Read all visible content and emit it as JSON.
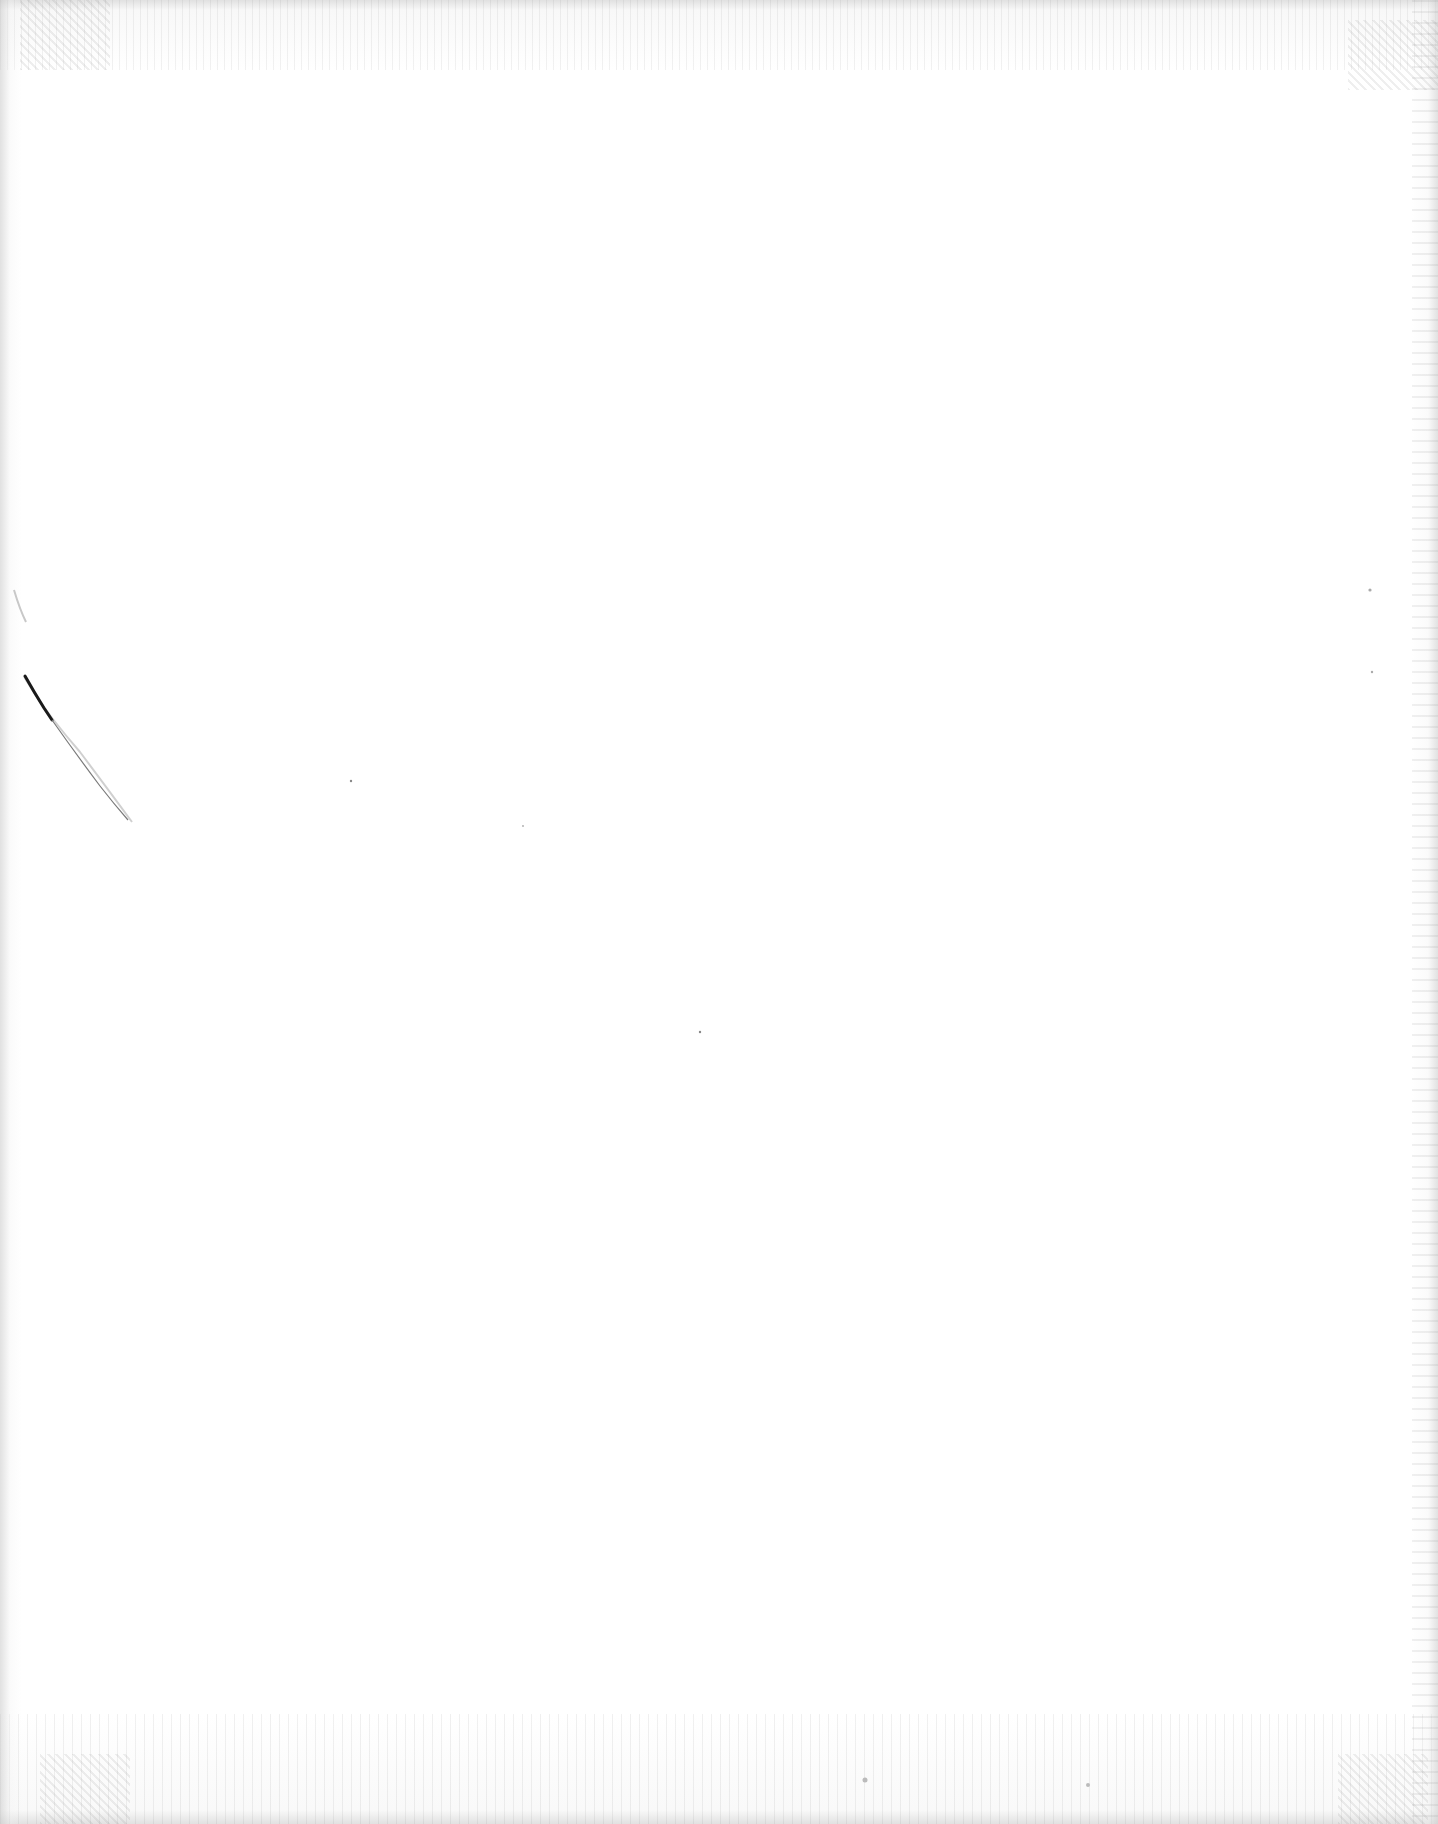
{
  "document": {
    "page": {
      "width": 1438,
      "height": 1824,
      "background_color": "#ffffff",
      "content": "blank",
      "text_blocks": []
    },
    "artifacts": {
      "scan_noise": "speckle along top, bottom and right edges",
      "left_mark": "curved pen/crease stroke near left margin",
      "stroke_color": "#1a1a1a"
    }
  }
}
